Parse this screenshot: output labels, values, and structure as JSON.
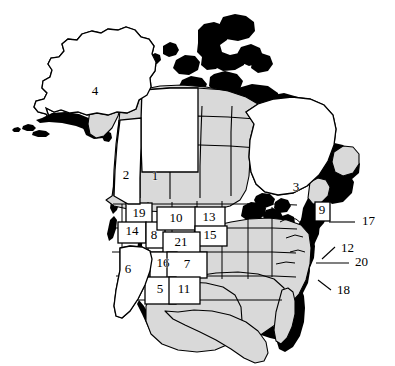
{
  "figure": {
    "type": "reference-map",
    "projection_region": "North America",
    "background_color": "#ffffff",
    "land_fill_color": "#d9d9d9",
    "numbered_region_fill_color": "#ffffff",
    "outline_color": "#000000",
    "coast_shadow_color": "#000000"
  },
  "labels_inside": [
    {
      "id": "1",
      "text": "1",
      "x": 155,
      "y": 177
    },
    {
      "id": "2",
      "text": "2",
      "x": 126,
      "y": 176
    },
    {
      "id": "3",
      "text": "3",
      "x": 296,
      "y": 188
    },
    {
      "id": "4",
      "text": "4",
      "x": 95,
      "y": 92
    },
    {
      "id": "5",
      "text": "5",
      "x": 160,
      "y": 290
    },
    {
      "id": "6",
      "text": "6",
      "x": 128,
      "y": 270
    },
    {
      "id": "7",
      "text": "7",
      "x": 187,
      "y": 265
    },
    {
      "id": "8",
      "text": "8",
      "x": 154,
      "y": 236
    },
    {
      "id": "9",
      "text": "9",
      "x": 322,
      "y": 211
    },
    {
      "id": "10",
      "text": "10",
      "x": 176,
      "y": 219
    },
    {
      "id": "11",
      "text": "11",
      "x": 184,
      "y": 290
    },
    {
      "id": "13",
      "text": "13",
      "x": 209,
      "y": 218
    },
    {
      "id": "14",
      "text": "14",
      "x": 132,
      "y": 232
    },
    {
      "id": "15",
      "text": "15",
      "x": 210,
      "y": 236
    },
    {
      "id": "16",
      "text": "16",
      "x": 163,
      "y": 264
    },
    {
      "id": "19",
      "text": "19",
      "x": 139,
      "y": 214
    },
    {
      "id": "21",
      "text": "21",
      "x": 181,
      "y": 243
    }
  ],
  "labels_outside": [
    {
      "id": "17",
      "text": "17",
      "x": 362,
      "y": 222,
      "leader": {
        "x1": 329,
        "y1": 222,
        "x2": 355,
        "y2": 222,
        "style": "horizontal"
      }
    },
    {
      "id": "12",
      "text": "12",
      "x": 341,
      "y": 249,
      "leader": {
        "x1": 322,
        "y1": 259,
        "x2": 335,
        "y2": 247,
        "style": "diagonal"
      }
    },
    {
      "id": "20",
      "text": "20",
      "x": 355,
      "y": 263,
      "leader": {
        "x1": 316,
        "y1": 263,
        "x2": 349,
        "y2": 263,
        "style": "horizontal"
      }
    },
    {
      "id": "18",
      "text": "18",
      "x": 337,
      "y": 291,
      "leader": {
        "x1": 318,
        "y1": 280,
        "x2": 331,
        "y2": 290,
        "style": "diagonal"
      }
    }
  ],
  "legend_note": "",
  "counts": {
    "total_labels": 21,
    "inside": 17,
    "outside": 4
  }
}
